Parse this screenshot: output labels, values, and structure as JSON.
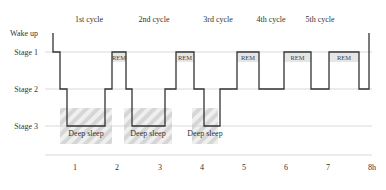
{
  "diagram": {
    "y_levels": [
      {
        "label": "Wake up",
        "y": 33
      },
      {
        "label": "Stage 1",
        "y": 52
      },
      {
        "label": "Stage 2",
        "y": 89
      },
      {
        "label": "Stage 3",
        "y": 126
      }
    ],
    "cycles": [
      {
        "label": "1st cycle",
        "x": 89
      },
      {
        "label": "2nd cycle",
        "x": 154
      },
      {
        "label": "3rd cycle",
        "x": 218
      },
      {
        "label": "4th cycle",
        "x": 271
      },
      {
        "label": "5th cycle",
        "x": 320
      }
    ],
    "x_ticks": [
      {
        "label": "1",
        "x": 75
      },
      {
        "label": "2",
        "x": 117
      },
      {
        "label": "3",
        "x": 160
      },
      {
        "label": "4",
        "x": 202
      },
      {
        "label": "5",
        "x": 244
      },
      {
        "label": "6",
        "x": 286
      },
      {
        "label": "7",
        "x": 328
      },
      {
        "label": "8h",
        "x": 372
      }
    ],
    "rem_label": "REM",
    "rem_blocks": [
      {
        "x": 112,
        "w": 14
      },
      {
        "x": 176,
        "w": 18
      },
      {
        "x": 237,
        "w": 22
      },
      {
        "x": 284,
        "w": 27
      },
      {
        "x": 329,
        "w": 30
      }
    ],
    "deep_label": "Deep sleep",
    "deep_blocks": [
      {
        "x": 60,
        "w": 52
      },
      {
        "x": 124,
        "w": 48
      },
      {
        "x": 192,
        "w": 26
      }
    ],
    "hypnogram_points": "53,33 53,52 60,52 60,89 67,89 67,126 105,126 105,89 112,89 112,52 126,52 126,89 132,89 132,126 165,126 165,89 176,89 176,52 194,52 194,89 204,89 204,126 220,126 220,89 237,89 237,52 259,52 259,89 284,89 284,52 311,52 311,89 329,89 329,52 359,52 359,89 369,89 369,33",
    "colors": {
      "line": "#333333",
      "grid": "#cfcfcf",
      "hatch": "#d9d9d9"
    }
  }
}
